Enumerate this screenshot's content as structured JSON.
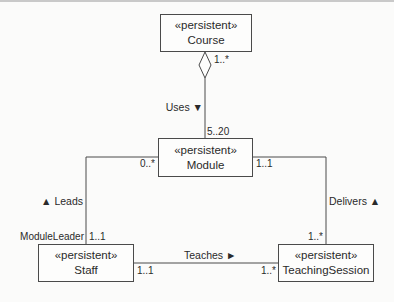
{
  "diagram": {
    "type": "UML class diagram",
    "classes": [
      {
        "id": "course",
        "stereotype": "«persistent»",
        "name": "Course"
      },
      {
        "id": "module",
        "stereotype": "«persistent»",
        "name": "Module"
      },
      {
        "id": "staff",
        "stereotype": "«persistent»",
        "name": "Staff"
      },
      {
        "id": "teachingsession",
        "stereotype": "«persistent»",
        "name": "TeachingSession"
      }
    ],
    "associations": [
      {
        "id": "uses",
        "label": "Uses ▼",
        "from": "course",
        "to": "module",
        "kind": "aggregation",
        "from_multiplicity": "1..*",
        "to_multiplicity": "5..20"
      },
      {
        "id": "leads",
        "label": "▲ Leads",
        "from": "staff",
        "to": "module",
        "role": "ModuleLeader",
        "from_multiplicity": "1..1",
        "to_multiplicity": "0..*"
      },
      {
        "id": "delivers",
        "label": "Delivers ▲",
        "from": "module",
        "to": "teachingsession",
        "from_multiplicity": "1..1",
        "to_multiplicity": "1..*"
      },
      {
        "id": "teaches",
        "label": "Teaches ►",
        "from": "staff",
        "to": "teachingsession",
        "from_multiplicity": "1..1",
        "to_multiplicity": "1..*"
      }
    ]
  },
  "colors": {
    "line": "#4a4a4a",
    "background": "#fbfbfa"
  }
}
